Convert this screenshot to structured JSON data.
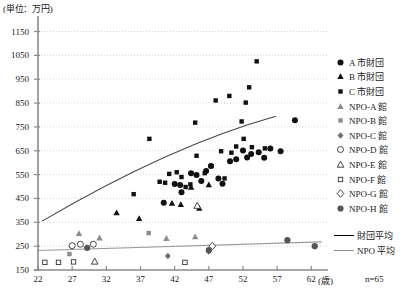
{
  "chart_data": {
    "type": "scatter",
    "title": "",
    "unit_label": "(単位：万円)",
    "xlabel": "(歳)",
    "ylabel": "",
    "n_label": "n=65",
    "xlim": [
      22,
      64
    ],
    "ylim": [
      150,
      1190
    ],
    "xticks": [
      22,
      27,
      32,
      37,
      42,
      47,
      52,
      57,
      62
    ],
    "yticks": [
      150,
      250,
      350,
      450,
      550,
      650,
      750,
      850,
      950,
      1050,
      1150
    ],
    "grid": "horizontal-dotted",
    "legend_position": "right",
    "series": [
      {
        "name": "A 市財団",
        "marker": "filled-circle",
        "color": "#111111",
        "points": [
          [
            40.4,
            432
          ],
          [
            42.0,
            511
          ],
          [
            42.8,
            506
          ],
          [
            43.0,
            476
          ],
          [
            44.4,
            556
          ],
          [
            45.2,
            548
          ],
          [
            45.9,
            523
          ],
          [
            46.6,
            565
          ],
          [
            47.3,
            586
          ],
          [
            48.4,
            534
          ],
          [
            49.0,
            512
          ],
          [
            50.1,
            606
          ],
          [
            51.0,
            614
          ],
          [
            52.0,
            651
          ],
          [
            52.6,
            622
          ],
          [
            53.2,
            636
          ],
          [
            54.3,
            644
          ],
          [
            55.1,
            621
          ],
          [
            56.0,
            659
          ],
          [
            57.5,
            648
          ],
          [
            59.6,
            778
          ]
        ]
      },
      {
        "name": "B 市財団",
        "marker": "filled-triangle",
        "color": "#111111",
        "points": [
          [
            33.5,
            390
          ],
          [
            36.8,
            366
          ],
          [
            41.6,
            430
          ],
          [
            42.9,
            425
          ],
          [
            44.4,
            497
          ],
          [
            45.6,
            409
          ],
          [
            47.0,
            508
          ]
        ]
      },
      {
        "name": "C 市財団",
        "marker": "filled-square",
        "color": "#111111",
        "points": [
          [
            36.0,
            468
          ],
          [
            38.3,
            700
          ],
          [
            39.8,
            520
          ],
          [
            40.6,
            516
          ],
          [
            41.2,
            553
          ],
          [
            42.3,
            560
          ],
          [
            43.0,
            540
          ],
          [
            43.6,
            498
          ],
          [
            44.3,
            509
          ],
          [
            45.2,
            629
          ],
          [
            46.4,
            556
          ],
          [
            47.4,
            586
          ],
          [
            48.0,
            861
          ],
          [
            48.8,
            648
          ],
          [
            49.3,
            534
          ],
          [
            50.0,
            880
          ],
          [
            50.3,
            642
          ],
          [
            51.0,
            668
          ],
          [
            51.8,
            773
          ],
          [
            52.1,
            700
          ],
          [
            52.4,
            852
          ],
          [
            52.9,
            916
          ],
          [
            53.3,
            665
          ],
          [
            54.0,
            1025
          ],
          [
            55.2,
            660
          ],
          [
            45.0,
            768
          ]
        ]
      },
      {
        "name": "NPO-A 館",
        "marker": "gray-triangle",
        "color": "#8c8c8c",
        "points": [
          [
            28.0,
            303
          ],
          [
            31.0,
            285
          ],
          [
            40.8,
            283
          ],
          [
            45.0,
            290
          ]
        ]
      },
      {
        "name": "NPO-B 館",
        "marker": "gray-square",
        "color": "#8c8c8c",
        "points": [
          [
            26.6,
            217
          ],
          [
            38.2,
            305
          ]
        ]
      },
      {
        "name": "NPO-C 館",
        "marker": "gray-diamond",
        "color": "#6f6f6f",
        "points": [
          [
            41.0,
            209
          ],
          [
            47.0,
            228
          ]
        ]
      },
      {
        "name": "NPO-D 館",
        "marker": "open-circle",
        "color": "#ffffff",
        "points": [
          [
            27.0,
            252
          ],
          [
            28.2,
            258
          ],
          [
            30.1,
            258
          ]
        ]
      },
      {
        "name": "NPO-E 館",
        "marker": "open-triangle",
        "color": "#ffffff",
        "points": [
          [
            30.3,
            186
          ],
          [
            45.3,
            420
          ]
        ]
      },
      {
        "name": "NPO-F 館",
        "marker": "open-square",
        "color": "#ffffff",
        "points": [
          [
            23.0,
            182
          ],
          [
            25.0,
            182
          ],
          [
            27.2,
            184
          ],
          [
            43.5,
            182
          ]
        ]
      },
      {
        "name": "NPO-G 館",
        "marker": "open-diamond",
        "color": "#ffffff",
        "points": [
          [
            47.5,
            250
          ]
        ]
      },
      {
        "name": "NPO-H 館",
        "marker": "gray-circle",
        "color": "#555555",
        "points": [
          [
            29.2,
            243
          ],
          [
            47.0,
            233
          ],
          [
            58.5,
            275
          ],
          [
            62.5,
            250
          ]
        ]
      }
    ],
    "trendlines": [
      {
        "name": "財団平均",
        "color": "#444444",
        "from": [
          22.6,
          355
        ],
        "to": [
          56.8,
          795
        ],
        "curve": "slight-convex"
      },
      {
        "name": "NPO 平均",
        "color": "#9a9a9a",
        "from": [
          22.0,
          232
        ],
        "to": [
          63.5,
          268
        ],
        "curve": "linear"
      }
    ]
  },
  "legend": {
    "items": [
      {
        "label": "A 市財団",
        "marker": "filled-circle"
      },
      {
        "label": "B 市財団",
        "marker": "filled-triangle"
      },
      {
        "label": "C 市財団",
        "marker": "filled-square"
      },
      {
        "label": "NPO-A 館",
        "marker": "gray-triangle"
      },
      {
        "label": "NPO-B 館",
        "marker": "gray-square"
      },
      {
        "label": "NPO-C 館",
        "marker": "gray-diamond"
      },
      {
        "label": "NPO-D 館",
        "marker": "open-circle"
      },
      {
        "label": "NPO-E 館",
        "marker": "open-triangle"
      },
      {
        "label": "NPO-F 館",
        "marker": "open-square"
      },
      {
        "label": "NPO-G 館",
        "marker": "open-diamond"
      },
      {
        "label": "NPO-H 館",
        "marker": "gray-circle"
      }
    ],
    "lines": [
      {
        "label": "財団平均",
        "style": "dark"
      },
      {
        "label": "NPO 平均",
        "style": "gray"
      }
    ]
  },
  "colors": {
    "dark": "#111111",
    "gray": "#8c8c8c",
    "grid": "#c9c9c9",
    "axis": "#8a8a8a",
    "trend_dark": "#444444",
    "trend_gray": "#9a9a9a"
  }
}
